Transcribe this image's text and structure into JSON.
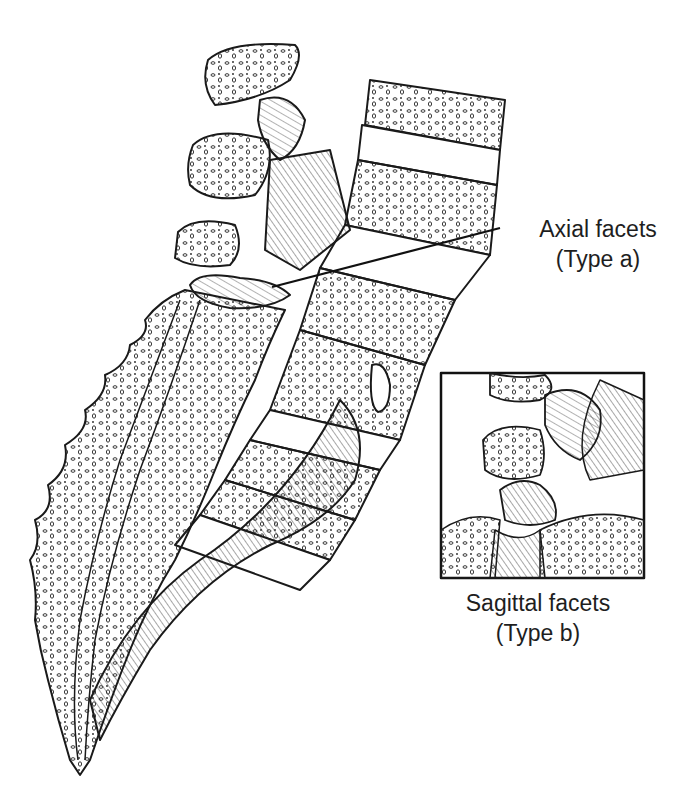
{
  "figure": {
    "labels": {
      "axial": {
        "title": "Axial facets",
        "subtitle": "(Type a)"
      },
      "sagittal": {
        "title": "Sagittal facets",
        "subtitle": "(Type b)"
      }
    },
    "inset": {
      "description": "Enlarged view of facet joint"
    },
    "colors": {
      "ink": "#1e1e1e",
      "background": "#ffffff"
    }
  }
}
